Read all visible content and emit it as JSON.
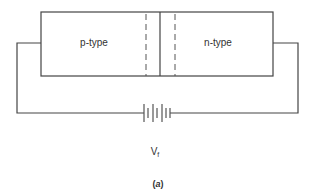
{
  "diagram": {
    "regions": [
      {
        "id": "p",
        "label": "p-type"
      },
      {
        "id": "n",
        "label": "n-type"
      }
    ],
    "source": {
      "label": "V",
      "subscript": "f"
    },
    "caption_open": "(",
    "caption_letter": "a",
    "caption_close": ")",
    "colors": {
      "line": "#444444",
      "text": "#333333",
      "background": "#ffffff"
    }
  }
}
